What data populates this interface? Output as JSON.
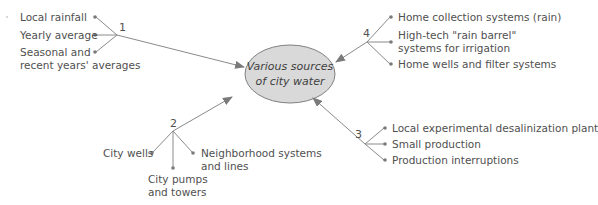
{
  "center": {
    "line1": "Various sources",
    "line2": "of city water",
    "fill": "#d9d9d9",
    "stroke": "#808080"
  },
  "branches": [
    {
      "number": "1",
      "items": [
        "Local rainfall",
        "Yearly average",
        "Seasonal and",
        "recent years' averages"
      ]
    },
    {
      "number": "2",
      "items": [
        "City wells",
        "City pumps",
        "and towers",
        "Neighborhood systems",
        "and lines"
      ]
    },
    {
      "number": "3",
      "items": [
        "Local experimental desalinization plant",
        "Small production",
        "Production interruptions"
      ]
    },
    {
      "number": "4",
      "items": [
        "Home collection systems (rain)",
        "High-tech \"rain barrel\"",
        "systems for irrigation",
        "Home wells and filter systems"
      ]
    }
  ],
  "colors": {
    "line": "#8a8a8a",
    "text": "#505050",
    "arrowhead": "#7a7a7a"
  }
}
